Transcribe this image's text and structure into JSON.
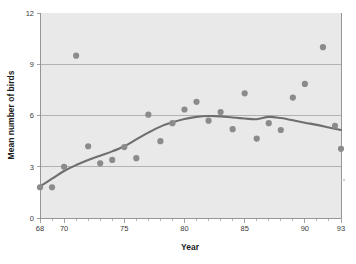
{
  "chart_data": {
    "type": "scatter",
    "title": "",
    "xlabel": "Year",
    "ylabel": "Mean number of birds",
    "xlim": [
      68,
      93
    ],
    "ylim": [
      0,
      12
    ],
    "grid": true,
    "legend": null,
    "x_ticks": [
      68,
      69,
      70,
      71,
      72,
      73,
      74,
      75,
      76,
      77,
      78,
      79,
      80,
      81,
      82,
      83,
      84,
      85,
      86,
      87,
      88,
      89,
      90,
      91,
      92,
      93
    ],
    "x_tick_labels": [
      "68",
      "70",
      "75",
      "80",
      "85",
      "90",
      "93"
    ],
    "x_labeled_values": [
      68,
      70,
      75,
      80,
      85,
      90,
      93
    ],
    "y_ticks": [
      0,
      3,
      6,
      9,
      12
    ],
    "y_tick_labels": [
      "0",
      "3",
      "6",
      "9",
      "12"
    ],
    "gridline_values": [
      3,
      6,
      9
    ],
    "point_color": "#8b8b8b",
    "line_color": "#6e6e6e",
    "plot_background": "#e9e9e9",
    "x": [
      68,
      69,
      70,
      71,
      72,
      73,
      74,
      75,
      76,
      77,
      78,
      79,
      80,
      81,
      82,
      83,
      84,
      85,
      86,
      87,
      88,
      89,
      90,
      91.5,
      92.5,
      93
    ],
    "values": [
      1.8,
      1.8,
      3.0,
      9.5,
      4.2,
      3.2,
      3.4,
      4.15,
      3.5,
      6.05,
      4.5,
      5.55,
      6.35,
      6.8,
      5.7,
      6.2,
      5.2,
      7.3,
      4.65,
      5.55,
      5.15,
      7.05,
      7.85,
      10.0,
      5.4,
      4.05
    ],
    "series": [
      {
        "name": "Mean number of birds",
        "type": "scatter",
        "points": [
          {
            "x": 68,
            "y": 1.8
          },
          {
            "x": 69,
            "y": 1.8
          },
          {
            "x": 70,
            "y": 3.0
          },
          {
            "x": 71,
            "y": 9.5
          },
          {
            "x": 72,
            "y": 4.2
          },
          {
            "x": 73,
            "y": 3.2
          },
          {
            "x": 74,
            "y": 3.4
          },
          {
            "x": 75,
            "y": 4.15
          },
          {
            "x": 76,
            "y": 3.5
          },
          {
            "x": 77,
            "y": 6.05
          },
          {
            "x": 78,
            "y": 4.5
          },
          {
            "x": 79,
            "y": 5.55
          },
          {
            "x": 80,
            "y": 6.35
          },
          {
            "x": 81,
            "y": 6.8
          },
          {
            "x": 82,
            "y": 5.7
          },
          {
            "x": 83,
            "y": 6.2
          },
          {
            "x": 84,
            "y": 5.2
          },
          {
            "x": 85,
            "y": 7.3
          },
          {
            "x": 86,
            "y": 4.65
          },
          {
            "x": 87,
            "y": 5.55
          },
          {
            "x": 88,
            "y": 5.15
          },
          {
            "x": 89,
            "y": 7.05
          },
          {
            "x": 90,
            "y": 7.85
          },
          {
            "x": 91.5,
            "y": 10.0
          },
          {
            "x": 92.5,
            "y": 5.4
          },
          {
            "x": 93,
            "y": 4.05
          }
        ]
      },
      {
        "name": "smoothed trend",
        "type": "line",
        "points": [
          {
            "x": 68,
            "y": 1.85
          },
          {
            "x": 69,
            "y": 2.3
          },
          {
            "x": 70,
            "y": 2.75
          },
          {
            "x": 71,
            "y": 3.1
          },
          {
            "x": 72,
            "y": 3.4
          },
          {
            "x": 73,
            "y": 3.65
          },
          {
            "x": 74,
            "y": 3.9
          },
          {
            "x": 75,
            "y": 4.2
          },
          {
            "x": 76,
            "y": 4.6
          },
          {
            "x": 77,
            "y": 5.0
          },
          {
            "x": 78,
            "y": 5.35
          },
          {
            "x": 79,
            "y": 5.6
          },
          {
            "x": 80,
            "y": 5.8
          },
          {
            "x": 81,
            "y": 5.92
          },
          {
            "x": 82,
            "y": 5.97
          },
          {
            "x": 83,
            "y": 5.95
          },
          {
            "x": 84,
            "y": 5.88
          },
          {
            "x": 85,
            "y": 5.82
          },
          {
            "x": 86,
            "y": 5.78
          },
          {
            "x": 87,
            "y": 5.92
          },
          {
            "x": 88,
            "y": 5.85
          },
          {
            "x": 89,
            "y": 5.72
          },
          {
            "x": 90,
            "y": 5.58
          },
          {
            "x": 91,
            "y": 5.45
          },
          {
            "x": 92,
            "y": 5.3
          },
          {
            "x": 93,
            "y": 5.15
          }
        ]
      }
    ]
  }
}
